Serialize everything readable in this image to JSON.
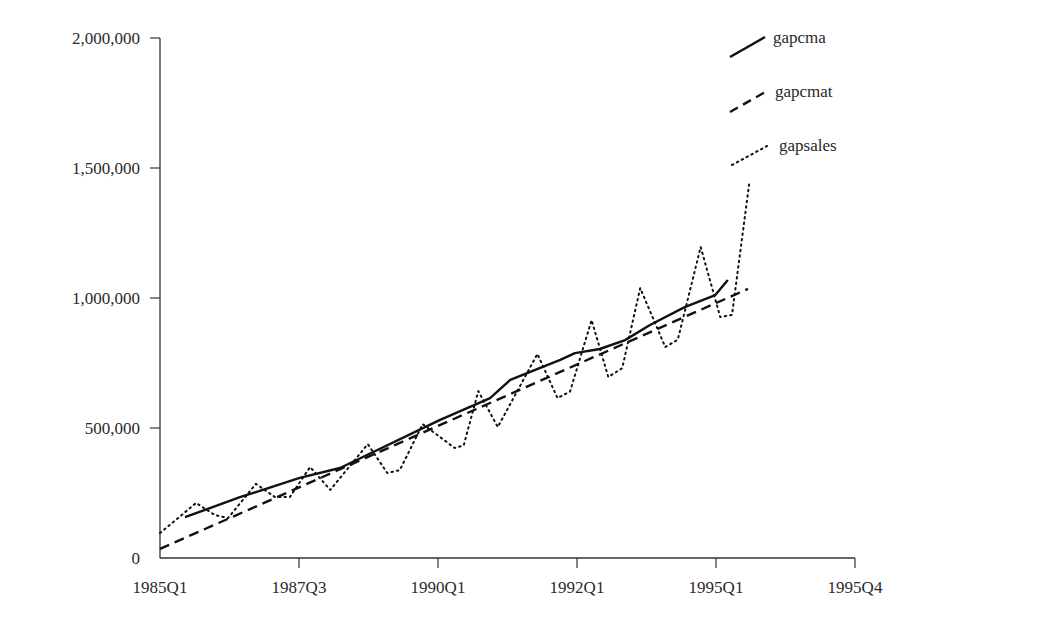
{
  "chart_data": {
    "type": "line",
    "title": "",
    "xlabel": "",
    "ylabel": "",
    "ylim": [
      0,
      2000000
    ],
    "grid": false,
    "legend_position": "top-right",
    "x_tick_labels": [
      "1985Q1",
      "1987Q3",
      "1990Q1",
      "1992Q1",
      "1995Q1",
      "1995Q4"
    ],
    "y_tick_labels": [
      "0",
      "500,000",
      "1,000,000",
      "1,500,000",
      "2,000,000"
    ],
    "y_tick_values": [
      0,
      500000,
      1000000,
      1500000,
      2000000
    ],
    "x_note": "points given as [x_fraction_of_axis (0=1985Q1, 1=1995Q4), value]",
    "series": [
      {
        "name": "gapcma",
        "style": "solid",
        "points": [
          [
            0.036,
            157000
          ],
          [
            0.115,
            234000
          ],
          [
            0.201,
            308000
          ],
          [
            0.259,
            346000
          ],
          [
            0.403,
            531000
          ],
          [
            0.475,
            615000
          ],
          [
            0.504,
            685000
          ],
          [
            0.547,
            731000
          ],
          [
            0.576,
            762000
          ],
          [
            0.597,
            788000
          ],
          [
            0.633,
            804000
          ],
          [
            0.669,
            838000
          ],
          [
            0.705,
            896000
          ],
          [
            0.755,
            965000
          ],
          [
            0.799,
            1011000
          ],
          [
            0.817,
            1069000
          ]
        ]
      },
      {
        "name": "gapcmat",
        "style": "dashed",
        "points": [
          [
            0.0,
            35000
          ],
          [
            0.846,
            1035000
          ]
        ]
      },
      {
        "name": "gapsales",
        "style": "dotted",
        "points": [
          [
            0.0,
            96000
          ],
          [
            0.014,
            127000
          ],
          [
            0.052,
            212000
          ],
          [
            0.079,
            165000
          ],
          [
            0.098,
            154000
          ],
          [
            0.138,
            285000
          ],
          [
            0.165,
            235000
          ],
          [
            0.187,
            235000
          ],
          [
            0.216,
            350000
          ],
          [
            0.245,
            262000
          ],
          [
            0.299,
            438000
          ],
          [
            0.327,
            327000
          ],
          [
            0.345,
            338000
          ],
          [
            0.378,
            515000
          ],
          [
            0.424,
            423000
          ],
          [
            0.437,
            433000
          ],
          [
            0.458,
            642000
          ],
          [
            0.486,
            504000
          ],
          [
            0.543,
            785000
          ],
          [
            0.572,
            615000
          ],
          [
            0.59,
            640000
          ],
          [
            0.621,
            915000
          ],
          [
            0.645,
            696000
          ],
          [
            0.665,
            730000
          ],
          [
            0.691,
            1038000
          ],
          [
            0.727,
            811000
          ],
          [
            0.745,
            840000
          ],
          [
            0.778,
            1196000
          ],
          [
            0.806,
            927000
          ],
          [
            0.823,
            935000
          ],
          [
            0.848,
            1446000
          ]
        ]
      }
    ]
  },
  "legend": {
    "items": [
      {
        "label": "gapcma",
        "style": "solid"
      },
      {
        "label": "gapcmat",
        "style": "dashed"
      },
      {
        "label": "gapsales",
        "style": "dotted"
      }
    ]
  }
}
